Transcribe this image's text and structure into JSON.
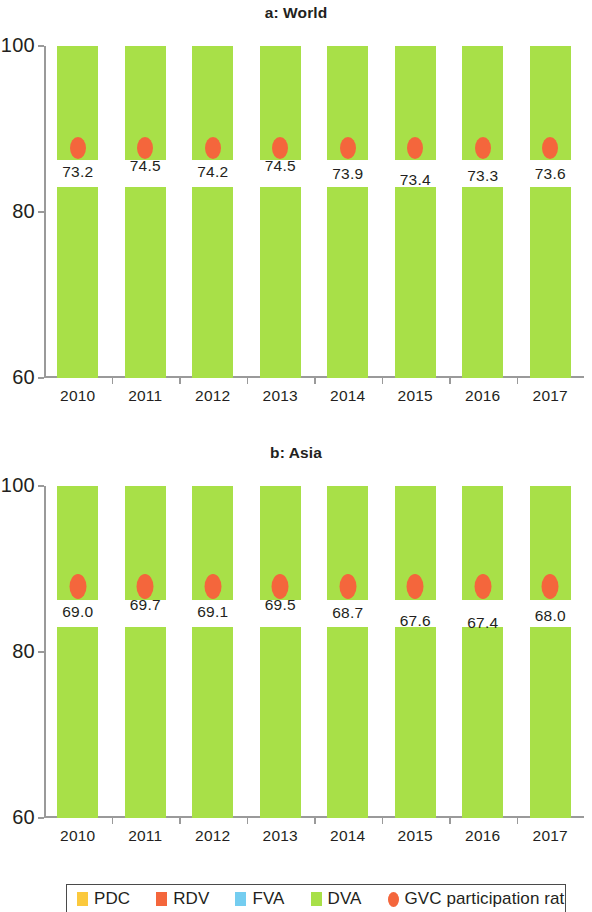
{
  "figure": {
    "panels": [
      {
        "id": "world",
        "title": "a: World"
      },
      {
        "id": "asia",
        "title": "b: Asia"
      }
    ]
  },
  "legend": {
    "items": [
      {
        "label": "PDC",
        "color": "#fbc93d",
        "shape": "square"
      },
      {
        "label": "RDV",
        "color": "#f4663c",
        "shape": "square"
      },
      {
        "label": "FVA",
        "color": "#74cdf0",
        "shape": "square"
      },
      {
        "label": "DVA",
        "color": "#a8e048",
        "shape": "square"
      },
      {
        "label": "GVC participation rate",
        "color": "#f4663c",
        "shape": "ellipse"
      }
    ]
  },
  "chart_data": [
    {
      "type": "bar",
      "id": "world",
      "title": "a: World",
      "subtitle": "",
      "xlabel": "",
      "ylabel": "",
      "ylim": [
        60,
        100
      ],
      "yticks": [
        60,
        80,
        100
      ],
      "ytick_labels": [
        "60",
        "80",
        "100"
      ],
      "grid": false,
      "stacked": true,
      "legend_position": "bottom",
      "categories": [
        "2010",
        "2011",
        "2012",
        "2013",
        "2014",
        "2015",
        "2016",
        "2017"
      ],
      "series": [
        {
          "name": "DVA",
          "color": "#a8e048",
          "values": [
            71.8,
            71.0,
            71.5,
            70.9,
            71.1,
            71.5,
            71.7,
            70.9
          ]
        },
        {
          "name": "FVA",
          "color": "#74cdf0",
          "values": [
            11.0,
            12.2,
            11.6,
            12.2,
            11.9,
            11.1,
            11.2,
            11.9
          ]
        },
        {
          "name": "RDV",
          "color": "#f4663c",
          "values": [
            3.2,
            3.1,
            3.1,
            3.1,
            3.1,
            3.2,
            3.1,
            3.1
          ]
        },
        {
          "name": "PDC",
          "color": "#fbc93d",
          "values": [
            14.0,
            13.7,
            13.8,
            13.8,
            13.9,
            14.2,
            14.0,
            14.1
          ]
        }
      ],
      "overlay": {
        "name": "GVC participation rate",
        "color": "#f4663c",
        "marker": "ellipse",
        "values": [
          73.2,
          74.5,
          74.2,
          74.5,
          73.9,
          73.4,
          73.3,
          73.6
        ],
        "labels": [
          "73.2",
          "74.5",
          "74.2",
          "74.5",
          "73.9",
          "73.4",
          "73.3",
          "73.6"
        ]
      }
    },
    {
      "type": "bar",
      "id": "asia",
      "title": "b: Asia",
      "subtitle": "",
      "xlabel": "",
      "ylabel": "",
      "ylim": [
        60,
        100
      ],
      "yticks": [
        60,
        80,
        100
      ],
      "ytick_labels": [
        "60",
        "80",
        "100"
      ],
      "grid": false,
      "stacked": true,
      "legend_position": "bottom",
      "categories": [
        "2010",
        "2011",
        "2012",
        "2013",
        "2014",
        "2015",
        "2016",
        "2017"
      ],
      "series": [
        {
          "name": "DVA",
          "color": "#a8e048",
          "values": [
            74.5,
            73.0,
            73.3,
            73.5,
            74.5,
            76.0,
            77.0,
            76.0
          ]
        },
        {
          "name": "FVA",
          "color": "#74cdf0",
          "values": [
            17.8,
            19.3,
            18.8,
            18.6,
            17.6,
            16.2,
            15.1,
            16.2
          ]
        },
        {
          "name": "RDV",
          "color": "#f4663c",
          "values": [
            1.0,
            1.1,
            1.0,
            1.1,
            1.1,
            1.2,
            1.2,
            1.1
          ]
        },
        {
          "name": "PDC",
          "color": "#fbc93d",
          "values": [
            6.7,
            6.6,
            6.9,
            6.8,
            6.8,
            6.6,
            6.7,
            6.7
          ]
        }
      ],
      "overlay": {
        "name": "GVC participation rate",
        "color": "#f4663c",
        "marker": "ellipse",
        "values": [
          69.0,
          69.7,
          69.1,
          69.5,
          68.7,
          67.6,
          67.4,
          68.0
        ],
        "labels": [
          "69.0",
          "69.7",
          "69.1",
          "69.5",
          "68.7",
          "67.6",
          "67.4",
          "68.0"
        ]
      }
    }
  ]
}
